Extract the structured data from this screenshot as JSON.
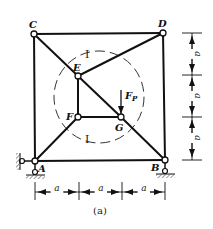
{
  "figure": {
    "caption": "(a)",
    "nodes": {
      "A": {
        "label": "A",
        "x": 35,
        "y": 161
      },
      "B": {
        "label": "B",
        "x": 165,
        "y": 160
      },
      "C": {
        "label": "C",
        "x": 34,
        "y": 34
      },
      "D": {
        "label": "D",
        "x": 163,
        "y": 33
      },
      "E": {
        "label": "E",
        "x": 78,
        "y": 76
      },
      "F": {
        "label": "F",
        "x": 78,
        "y": 117
      },
      "G": {
        "label": "G",
        "x": 121,
        "y": 117
      }
    },
    "members": [
      [
        "C",
        "D"
      ],
      [
        "C",
        "A"
      ],
      [
        "D",
        "B"
      ],
      [
        "A",
        "B"
      ],
      [
        "C",
        "E"
      ],
      [
        "E",
        "G"
      ],
      [
        "G",
        "B"
      ],
      [
        "E",
        "D"
      ],
      [
        "E",
        "F"
      ],
      [
        "F",
        "G"
      ],
      [
        "F",
        "A"
      ]
    ],
    "load": {
      "label": "F",
      "subscript": "P",
      "node": "G",
      "direction": "down"
    },
    "section_labels": {
      "top": "I",
      "bottom": "I"
    },
    "dimensions": {
      "horizontal": [
        "a",
        "a",
        "a"
      ],
      "vertical": [
        "a",
        "a",
        "a"
      ]
    },
    "supports": {
      "A": "fixed-pin (horizontal + vertical restraint)",
      "B": "roller/pin (vertical support)"
    },
    "colors": {
      "line": "#111111",
      "dashed": "#333333",
      "hatch": "#555555"
    }
  }
}
